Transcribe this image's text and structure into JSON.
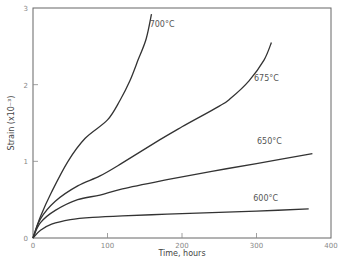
{
  "chart_data": {
    "type": "line",
    "title": "",
    "xlabel": "Time, hours",
    "ylabel": "Strain (x10⁻³)",
    "xlim": [
      0,
      400
    ],
    "ylim": [
      0,
      3
    ],
    "xticks": [
      "0",
      "100",
      "200",
      "300",
      "400"
    ],
    "yticks": [
      "0",
      "1",
      "2",
      "3"
    ],
    "grid": false,
    "legend": "inline labels at curve ends",
    "series": [
      {
        "name": "700°C",
        "x": [
          0,
          10,
          25,
          47,
          70,
          100,
          117,
          130,
          141,
          152,
          159
        ],
        "y": [
          0,
          0.28,
          0.6,
          1.0,
          1.3,
          1.54,
          1.8,
          2.05,
          2.32,
          2.6,
          2.92
        ]
      },
      {
        "name": "675°C",
        "x": [
          0,
          10,
          30,
          60,
          90,
          120,
          170,
          200,
          250,
          265,
          290,
          310,
          320
        ],
        "y": [
          0,
          0.25,
          0.48,
          0.68,
          0.81,
          0.98,
          1.28,
          1.45,
          1.72,
          1.82,
          2.05,
          2.32,
          2.55
        ]
      },
      {
        "name": "650°C",
        "x": [
          0,
          10,
          30,
          60,
          90,
          120,
          180,
          240,
          300,
          375
        ],
        "y": [
          0,
          0.2,
          0.36,
          0.5,
          0.56,
          0.64,
          0.76,
          0.87,
          0.97,
          1.1
        ]
      },
      {
        "name": "600°C",
        "x": [
          0,
          10,
          25,
          50,
          80,
          120,
          180,
          240,
          300,
          370
        ],
        "y": [
          0,
          0.1,
          0.18,
          0.24,
          0.27,
          0.29,
          0.31,
          0.33,
          0.35,
          0.38
        ]
      }
    ],
    "labels": [
      {
        "text": "700°C",
        "x": 190,
        "y": 2.75
      },
      {
        "text": "675°C",
        "x": 330,
        "y": 2.05
      },
      {
        "text": "650°C",
        "x": 334,
        "y": 1.22
      },
      {
        "text": "600°C",
        "x": 329,
        "y": 0.48
      }
    ]
  }
}
